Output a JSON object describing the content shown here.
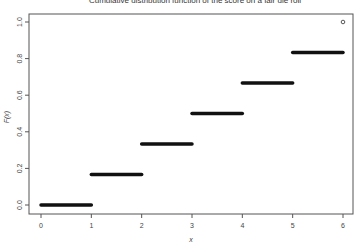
{
  "chart_data": {
    "type": "line",
    "subtype": "step-cdf",
    "title": "Cumulative distribution function of the score on a fair die roll",
    "xlabel": "x",
    "ylabel": "F(x)",
    "xlim": [
      0,
      6
    ],
    "ylim": [
      0,
      1
    ],
    "x_ticks": [
      "0",
      "1",
      "2",
      "3",
      "4",
      "5",
      "6"
    ],
    "y_ticks": [
      "0.0",
      "0.2",
      "0.4",
      "0.6",
      "0.8",
      "1.0"
    ],
    "grid": false,
    "legend": null,
    "segments": [
      {
        "x_start": 0,
        "x_end": 1,
        "y": 0.0
      },
      {
        "x_start": 1,
        "x_end": 2,
        "y": 0.1667
      },
      {
        "x_start": 2,
        "x_end": 3,
        "y": 0.3333
      },
      {
        "x_start": 3,
        "x_end": 4,
        "y": 0.5
      },
      {
        "x_start": 4,
        "x_end": 5,
        "y": 0.6667
      },
      {
        "x_start": 5,
        "x_end": 6,
        "y": 0.8333
      }
    ],
    "points": [
      {
        "x": 6,
        "y": 1.0,
        "marker": "open-circle"
      }
    ]
  }
}
